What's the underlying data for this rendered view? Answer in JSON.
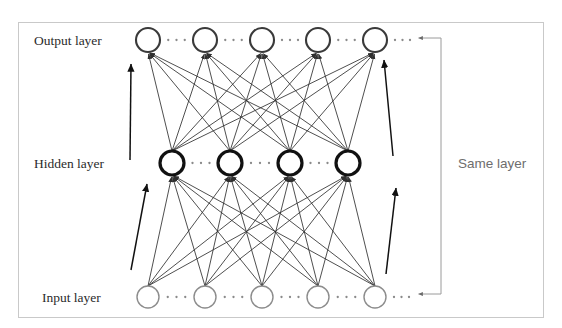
{
  "figure": {
    "partial_text_top": "",
    "border_color": "#c9c9c9",
    "background": "#ffffff"
  },
  "labels": {
    "output_layer": "Output layer",
    "hidden_layer": "Hidden layer",
    "input_layer": "Input layer",
    "same_layer": "Same layer"
  },
  "colors": {
    "output_node_stroke": "#3a3a3a",
    "hidden_node_stroke": "#111111",
    "input_node_stroke": "#8c8c8c",
    "connection_stroke": "#2f2f2f",
    "bold_arrow_stroke": "#111111",
    "bracket_stroke": "#9a9a9a",
    "label_text": "#2b2b2b",
    "side_label_text": "#6e6e6e",
    "ellipsis_dot": "#8a8a8a"
  },
  "diagram": {
    "type": "neural-network",
    "border": {
      "x": 18,
      "y": 22,
      "width": 526,
      "height": 296
    },
    "layers": [
      {
        "name": "output",
        "label": "Output layer",
        "label_x": 34,
        "label_y": 45,
        "node_count": 5,
        "node_radius": 12,
        "stroke_width": 2.1,
        "y": 40,
        "node_x": [
          148,
          205,
          262,
          318,
          375
        ]
      },
      {
        "name": "hidden",
        "label": "Hidden layer",
        "label_x": 34,
        "label_y": 168,
        "node_count": 4,
        "node_radius": 12,
        "stroke_width": 3.2,
        "y": 163,
        "node_x": [
          172,
          230,
          290,
          348
        ]
      },
      {
        "name": "input",
        "label": "Input layer",
        "label_x": 42,
        "label_y": 302,
        "node_count": 5,
        "node_radius": 11,
        "stroke_width": 1.4,
        "y": 297,
        "node_x": [
          148,
          205,
          262,
          318,
          375
        ]
      }
    ],
    "ellipses_between_nodes": true,
    "ellipsis_dots_per_gap": 3,
    "connections": [
      {
        "from_layer": "hidden",
        "to_layer": "output",
        "fully_connected": true,
        "arrowheads": true
      },
      {
        "from_layer": "input",
        "to_layer": "hidden",
        "fully_connected": true,
        "arrowheads": true
      }
    ],
    "bold_arrows": [
      {
        "name": "left-hidden-to-output",
        "x1": 130,
        "y1": 160,
        "x2": 131,
        "y2": 64
      },
      {
        "name": "left-input-to-hidden",
        "x1": 131,
        "y1": 270,
        "x2": 147,
        "y2": 184
      },
      {
        "name": "right-input-to-hidden",
        "x1": 386,
        "y1": 274,
        "x2": 396,
        "y2": 188
      },
      {
        "name": "right-hidden-to-output",
        "x1": 393,
        "y1": 156,
        "x2": 384,
        "y2": 60
      }
    ],
    "bracket": {
      "name": "same-layer-bracket",
      "top_arrow_tip_x": 416,
      "top_arrow_tip_y": 38,
      "bottom_arrow_tip_x": 416,
      "bottom_arrow_tip_y": 294,
      "spine_x": 441,
      "label_x": 458,
      "label_y": 168
    }
  }
}
